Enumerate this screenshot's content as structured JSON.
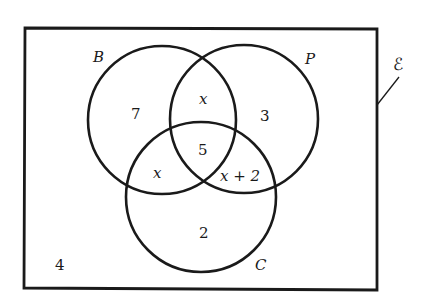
{
  "diagram": {
    "type": "venn-3-set",
    "universal_set": {
      "symbol": "ℰ"
    },
    "sets": [
      {
        "id": "B",
        "label": "B",
        "cx": 162,
        "cy": 120,
        "r": 74
      },
      {
        "id": "P",
        "label": "P",
        "cx": 244,
        "cy": 119,
        "r": 74
      },
      {
        "id": "C",
        "label": "C",
        "cx": 201,
        "cy": 197,
        "r": 75
      }
    ],
    "regions": {
      "B_only": "7",
      "P_only": "3",
      "C_only": "2",
      "B_and_P_only": "x",
      "B_and_C_only": "x",
      "P_and_C_only": "x + 2",
      "B_and_P_and_C": "5",
      "outside": "4"
    },
    "colors": {
      "stroke": "#1a1a1a",
      "background": "#ffffff"
    }
  }
}
